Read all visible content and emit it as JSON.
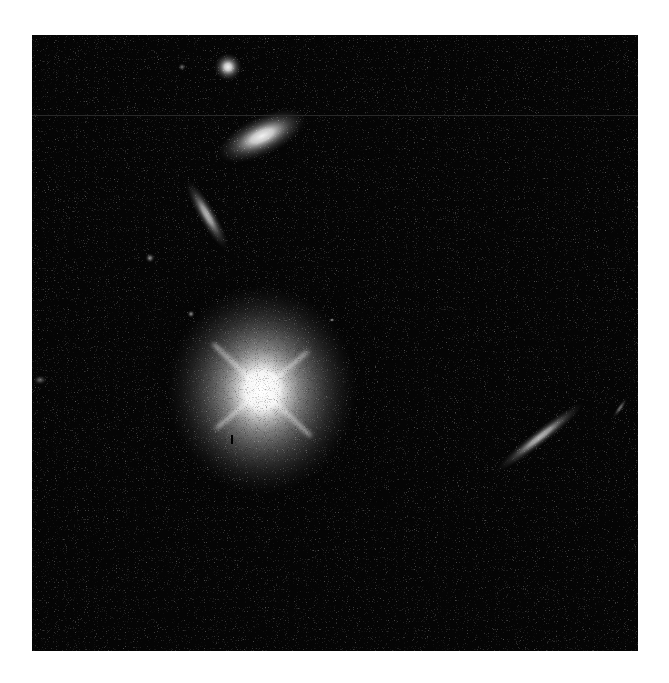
{
  "image": {
    "subject": "deep-field telescope image of a bright quasar host galaxy with nearby galaxies",
    "background_color": "#050505",
    "page_color": "#ffffff",
    "frame": {
      "x": 32,
      "y": 35,
      "width": 606,
      "height": 616
    }
  },
  "objects": [
    {
      "name": "quasar-host",
      "cx": 230,
      "cy": 355,
      "rx": 95,
      "ry": 105,
      "rotate": 0,
      "brightness": 1.0
    },
    {
      "name": "elliptical-galaxy",
      "cx": 230,
      "cy": 101,
      "rx": 48,
      "ry": 20,
      "rotate": -25,
      "brightness": 0.95
    },
    {
      "name": "compact-galaxy",
      "cx": 196,
      "cy": 32,
      "rx": 14,
      "ry": 14,
      "rotate": 0,
      "brightness": 0.95
    },
    {
      "name": "edge-on-galaxy-left",
      "cx": 175,
      "cy": 180,
      "rx": 40,
      "ry": 9,
      "rotate": 60,
      "brightness": 0.7
    },
    {
      "name": "edge-on-galaxy-right",
      "cx": 508,
      "cy": 402,
      "rx": 55,
      "ry": 8,
      "rotate": -38,
      "brightness": 0.7
    },
    {
      "name": "faint-streak",
      "cx": 588,
      "cy": 373,
      "rx": 12,
      "ry": 3,
      "rotate": -55,
      "brightness": 0.4
    },
    {
      "name": "faint-source-1",
      "cx": 118,
      "cy": 223,
      "rx": 5,
      "ry": 5,
      "rotate": 0,
      "brightness": 0.5
    },
    {
      "name": "faint-source-2",
      "cx": 159,
      "cy": 279,
      "rx": 4,
      "ry": 4,
      "rotate": 0,
      "brightness": 0.5
    },
    {
      "name": "faint-source-3",
      "cx": 8,
      "cy": 345,
      "rx": 7,
      "ry": 5,
      "rotate": 0,
      "brightness": 0.35
    },
    {
      "name": "faint-source-4",
      "cx": 150,
      "cy": 32,
      "rx": 4,
      "ry": 4,
      "rotate": 0,
      "brightness": 0.4
    },
    {
      "name": "faint-source-5",
      "cx": 300,
      "cy": 285,
      "rx": 3,
      "ry": 2,
      "rotate": 0,
      "brightness": 0.6
    }
  ]
}
